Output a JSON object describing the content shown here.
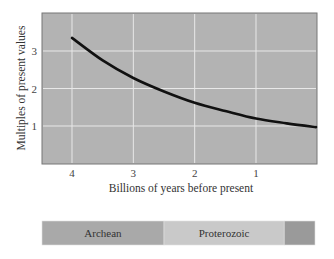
{
  "chart_data": {
    "type": "line",
    "title": "",
    "xlabel": "Billions of years before present",
    "ylabel": "Multiples of present values",
    "x_ticks": [
      "4",
      "3",
      "2",
      "1"
    ],
    "y_ticks": [
      "1",
      "2",
      "3"
    ],
    "xlim": [
      4.5,
      0
    ],
    "ylim": [
      0,
      3.9
    ],
    "x_reversed": true,
    "grid": true,
    "legend": null,
    "series": [
      {
        "name": "curve",
        "x": [
          4.0,
          3.5,
          3.0,
          2.5,
          2.0,
          1.5,
          1.0,
          0.5,
          0.0
        ],
        "y": [
          3.35,
          2.75,
          2.28,
          1.92,
          1.62,
          1.4,
          1.2,
          1.07,
          0.97
        ]
      }
    ],
    "colors": {
      "plot_bg": "#b3b3b3",
      "grid": "#e8e8e8",
      "line": "#111111",
      "archean": "#a9a9a9",
      "proterozoic": "#c9c9c9",
      "phanerozoic": "#9a9a9a"
    },
    "timeline": [
      {
        "label": "Archean",
        "start": 4.5,
        "end": 2.5
      },
      {
        "label": "Proterozoic",
        "start": 2.5,
        "end": 0.54
      },
      {
        "label": "",
        "start": 0.54,
        "end": 0
      }
    ]
  }
}
